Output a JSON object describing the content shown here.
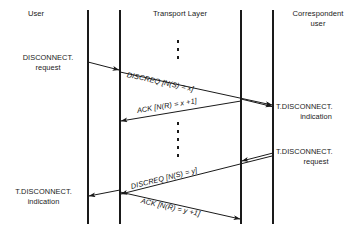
{
  "diagram": {
    "line_color": "#1a1a1a",
    "text_color": "#1a1a1a",
    "background": "#ffffff"
  },
  "columns": [
    {
      "id": "user",
      "label": "User"
    },
    {
      "id": "transport_layer",
      "label": "Transport Layer"
    },
    {
      "id": "correspondent_user",
      "label_line1": "Correspondent",
      "label_line2": "user"
    }
  ],
  "service_primitives": [
    {
      "id": "disconnect-request",
      "side": "left",
      "line1": "DISCONNECT.",
      "line2": "request"
    },
    {
      "id": "t-disconnect-indication-right",
      "side": "right",
      "line1": "T.DISCONNECT.",
      "line2": "indication"
    },
    {
      "id": "t-disconnect-request-right",
      "side": "right",
      "line1": "T.DISCONNECT.",
      "line2": "request"
    },
    {
      "id": "t-disconnect-indication-left",
      "side": "left",
      "line1": "T.DISCONNECT.",
      "line2": "indication"
    }
  ],
  "messages": [
    {
      "id": "discreq-x",
      "label": "DISCREQ [N(S) = x]",
      "direction": "left-to-right"
    },
    {
      "id": "ack-x-plus-1",
      "label": "ACK [N(R) = x +1]",
      "direction": "right-to-left"
    },
    {
      "id": "discreq-y",
      "label": "DISCREQ [N(S) = y]",
      "direction": "right-to-left"
    },
    {
      "id": "ack-y-plus-1",
      "label": "ACK [N(R) = y +1]",
      "direction": "left-to-right"
    }
  ],
  "ellipsis": [
    {
      "id": "ellipsis-top",
      "dots": 3
    },
    {
      "id": "ellipsis-middle",
      "dots": 5
    }
  ]
}
